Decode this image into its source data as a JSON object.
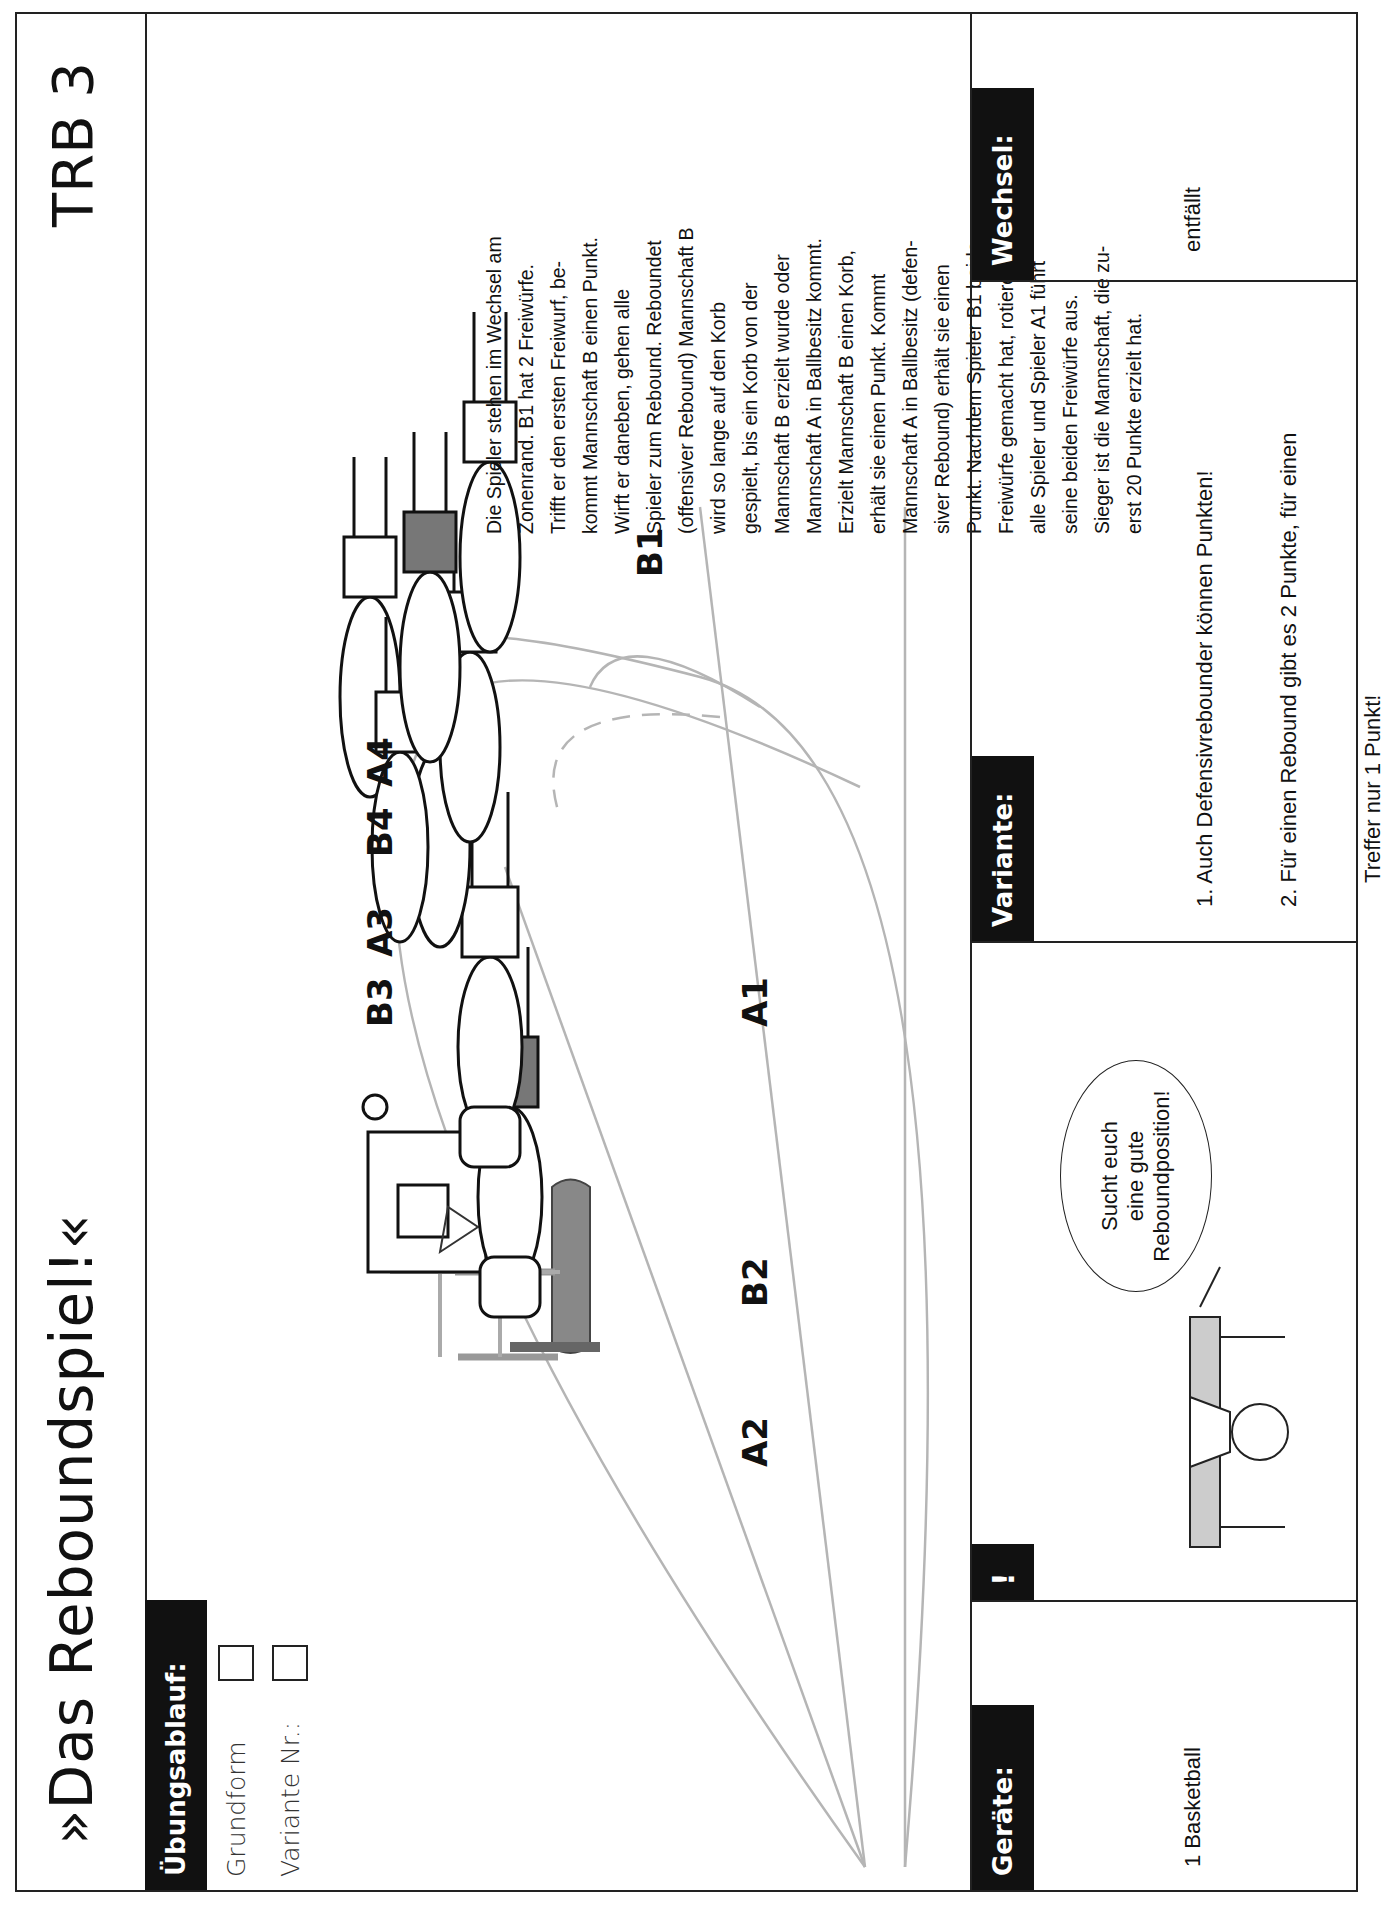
{
  "header": {
    "title": "»Das Reboundspiel!«",
    "code": "TRB 3"
  },
  "uebungsablauf": {
    "heading": "Übungsablauf:",
    "options": [
      {
        "label": "Grundform",
        "checked": false
      },
      {
        "label": "Variante Nr.:",
        "checked": false
      }
    ]
  },
  "diagram": {
    "players": [
      "A2",
      "B2",
      "B3",
      "A3",
      "A1",
      "B4",
      "A4",
      "B1"
    ],
    "equipment": "basketball hoop with padded post"
  },
  "description": {
    "lines": [
      "Die Spieler stehen im Wechsel am",
      "Zonenrand. B1 hat 2 Freiwürfe.",
      "Trifft er den ersten Freiwurf, be-",
      "kommt Mannschaft B einen Punkt.",
      "Wirft er daneben, gehen alle",
      "Spieler zum Rebound. Reboundet",
      "(offensiver Rebound) Mannschaft B",
      "wird so lange auf den Korb",
      "gespielt, bis ein Korb von der",
      "Mannschaft B erzielt wurde oder",
      "Mannschaft A in Ballbesitz kommt.",
      "Erzielt Mannschaft B einen Korb,",
      "erhält sie einen Punkt. Kommt",
      "Mannschaft A in Ballbesitz (defen-",
      "siver Rebound) erhält sie einen",
      "Punkt. Nachdem Spieler B1 beide",
      "Freiwürfe gemacht hat, rotieren",
      "alle Spieler und Spieler A1 führt",
      "seine beiden Freiwürfe aus.",
      "Sieger ist die Mannschaft, die zu-",
      "erst 20 Punkte erzielt hat."
    ]
  },
  "panels": {
    "geraete": {
      "heading": "Geräte:",
      "text": "1 Basketball"
    },
    "hinweis": {
      "heading": "!",
      "bubble": [
        "Sucht euch",
        "eine gute",
        "Reboundposition!"
      ]
    },
    "variante": {
      "heading": "Variante:",
      "items": [
        "1. Auch Defensivrebounder können Punkten!",
        "2. Für einen Rebound gibt es 2 Punkte, für einen",
        "    Treffer nur 1 Punkt!"
      ]
    },
    "wechsel": {
      "heading": "Wechsel:",
      "text": "entfällt"
    }
  }
}
